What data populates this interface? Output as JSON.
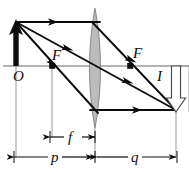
{
  "figure": {
    "type": "optics-ray-diagram",
    "background_color": "#ffffff",
    "ink_color": "#0d0d0d",
    "axis_color": "#9a9a9a",
    "guide_color": "#9a9a9a",
    "lens_fill_color": "#bcbcbc",
    "lens_stroke_color": "#8d8d8d",
    "image_arrow_fill": "#ffffff",
    "image_arrow_stroke": "#4d4d4d"
  },
  "labels": {
    "object_label": "O",
    "image_label": "I",
    "focal_left_label": "F",
    "focal_right_label": "F",
    "focal_length_label": "f",
    "object_distance_label": "p",
    "image_distance_label": "q"
  },
  "geometry": {
    "optical_axis_y": 66,
    "lens_center_x": 95,
    "lens_top_y": 8,
    "lens_bottom_y": 128,
    "lens_half_width": 10,
    "object_x": 16,
    "object_tip_y": 22,
    "object_base_y": 66,
    "image_x": 176,
    "image_tip_y": 110,
    "image_base_y": 66,
    "focal_left_x": 52,
    "focal_right_x": 130,
    "focal_dim_y": 137,
    "distance_dim_y": 157,
    "f_dim_start_x": 50,
    "f_dim_end_x": 95,
    "p_dim_start_x": 14,
    "p_dim_end_x": 93,
    "q_dim_start_x": 97,
    "q_dim_end_x": 176
  },
  "rays": [
    {
      "name": "parallel-ray",
      "description": "Ray leaving object tip parallel to axis, refracted through right focal point to image tip",
      "segments": [
        {
          "x1": 16,
          "y1": 22,
          "x2": 95,
          "y2": 22
        },
        {
          "x1": 95,
          "y1": 22,
          "x2": 176,
          "y2": 110
        }
      ],
      "arrow_positions": [
        {
          "x": 52,
          "y": 22,
          "dir": "right"
        },
        {
          "x": 132,
          "y": 62,
          "dir": "down-right"
        }
      ]
    },
    {
      "name": "center-ray",
      "description": "Ray leaving object tip through lens center, undeviated",
      "segments": [
        {
          "x1": 16,
          "y1": 22,
          "x2": 176,
          "y2": 110
        }
      ],
      "arrow_positions": [
        {
          "x": 70,
          "y": 51,
          "dir": "down-right"
        },
        {
          "x": 130,
          "y": 84,
          "dir": "down-right"
        }
      ]
    },
    {
      "name": "focal-ray",
      "description": "Ray leaving object tip through left focal point, refracted parallel to axis then to image tip",
      "segments": [
        {
          "x1": 16,
          "y1": 22,
          "x2": 95,
          "y2": 110
        },
        {
          "x1": 95,
          "y1": 110,
          "x2": 176,
          "y2": 110
        }
      ],
      "arrow_positions": [
        {
          "x": 55,
          "y": 65,
          "dir": "down-right"
        },
        {
          "x": 137,
          "y": 110,
          "dir": "right"
        }
      ]
    }
  ],
  "guides": [
    {
      "name": "object-vertical-guide",
      "x": 16,
      "y1": 66,
      "y2": 157
    },
    {
      "name": "focal-vertical-guide",
      "x": 52,
      "y1": 66,
      "y2": 137
    },
    {
      "name": "lens-vertical-guide",
      "x": 95,
      "y1": 128,
      "y2": 157
    },
    {
      "name": "image-vertical-guide",
      "x": 176,
      "y1": 66,
      "y2": 157
    },
    {
      "name": "image-top-guide",
      "x1": 176,
      "y1": 66,
      "x2": 189,
      "y2": 66
    }
  ]
}
